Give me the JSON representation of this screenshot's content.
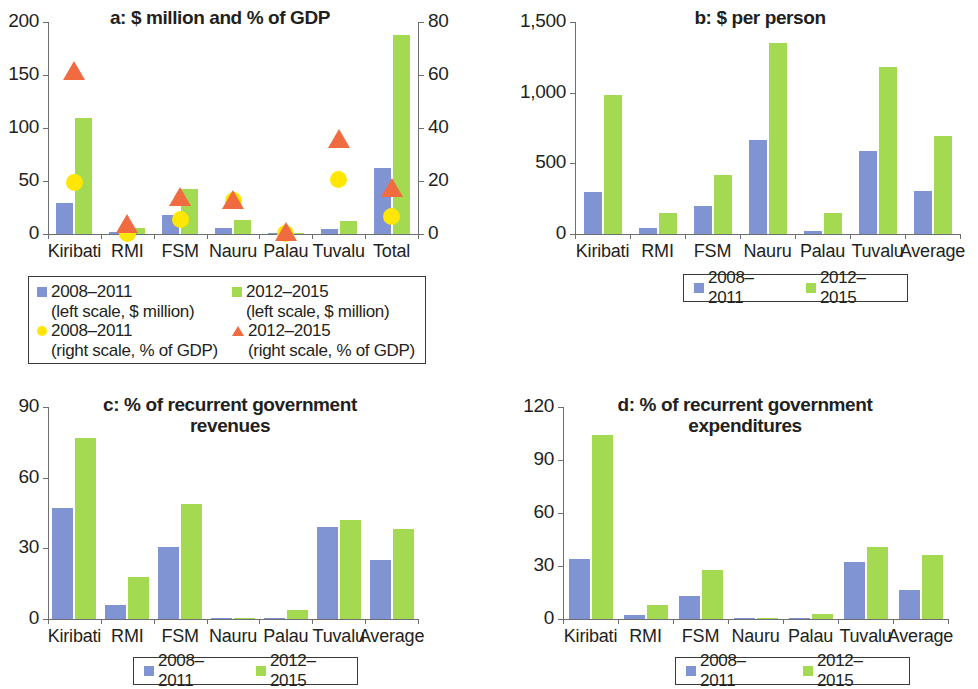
{
  "figure": {
    "panels": [
      "a",
      "b",
      "c",
      "d"
    ],
    "series_names": [
      "2008–2011",
      "2012–2015"
    ],
    "colors": {
      "blue": "#8094d4",
      "green": "#a3da51",
      "yellow": "#ffe605",
      "orange": "#f06c40",
      "axis": "#6d6e71",
      "text": "#231f20"
    }
  },
  "chart_data": [
    {
      "type": "bar",
      "panel": "a",
      "title": "a: $ million and % of GDP",
      "categories": [
        "Kiribati",
        "RMI",
        "FSM",
        "Nauru",
        "Palau",
        "Tuvalu",
        "Total"
      ],
      "xlabel": "",
      "ylabel": "",
      "ylim": [
        0,
        200
      ],
      "yticks": [
        0,
        50,
        100,
        150,
        200
      ],
      "ytick_labels": [
        "0",
        "50",
        "100",
        "150",
        "200"
      ],
      "y2lim": [
        0,
        80
      ],
      "y2ticks": [
        0,
        20,
        40,
        60,
        80
      ],
      "y2tick_labels": [
        "0",
        "20",
        "40",
        "60",
        "80"
      ],
      "grid": false,
      "legend_position": "below",
      "series": [
        {
          "name": "2008–2011 (left scale, $ million)",
          "type": "bar",
          "axis": "left",
          "color": "#8094d4",
          "values": [
            29,
            1.5,
            18,
            5.5,
            0.5,
            5,
            62
          ]
        },
        {
          "name": "2012–2015 (left scale, $ million)",
          "type": "bar",
          "axis": "left",
          "color": "#a3da51",
          "values": [
            109,
            5.5,
            42,
            13,
            1,
            12,
            188
          ]
        },
        {
          "name": "2008–2011 (right scale, % of GDP)",
          "type": "marker-circle",
          "axis": "right",
          "color": "#ffe605",
          "values": [
            19.5,
            0.3,
            5.5,
            12.5,
            0.2,
            20.5,
            6.5
          ]
        },
        {
          "name": "2012–2015 (right scale, % of GDP)",
          "type": "marker-triangle",
          "axis": "right",
          "color": "#f06c40",
          "values": [
            61,
            3.5,
            13.5,
            12.5,
            0.2,
            35.5,
            17
          ]
        }
      ],
      "legend": [
        {
          "marker": "square-blue",
          "line1": "2008–2011",
          "line2": "(left scale, $ million)"
        },
        {
          "marker": "square-green",
          "line1": "2012–2015",
          "line2": "(left scale, $ million)"
        },
        {
          "marker": "circle-yellow",
          "line1": "2008–2011",
          "line2": "(right scale, % of GDP)"
        },
        {
          "marker": "triangle-orange",
          "line1": "2012–2015",
          "line2": "(right scale, % of GDP)"
        }
      ]
    },
    {
      "type": "bar",
      "panel": "b",
      "title": "b: $ per person",
      "categories": [
        "Kiribati",
        "RMI",
        "FSM",
        "Nauru",
        "Palau",
        "Tuvalu",
        "Average"
      ],
      "xlabel": "",
      "ylabel": "",
      "ylim": [
        0,
        1500
      ],
      "yticks": [
        0,
        500,
        1000,
        1500
      ],
      "ytick_labels": [
        "0",
        "500",
        "1,000",
        "1,500"
      ],
      "grid": false,
      "legend_position": "below",
      "series": [
        {
          "name": "2008–2011",
          "color": "#8094d4",
          "values": [
            300,
            40,
            195,
            665,
            20,
            590,
            305
          ]
        },
        {
          "name": "2012–2015",
          "color": "#a3da51",
          "values": [
            980,
            150,
            420,
            1350,
            150,
            1185,
            690
          ]
        }
      ],
      "legend": [
        {
          "marker": "square-blue",
          "label": "2008–2011"
        },
        {
          "marker": "square-green",
          "label": "2012–2015"
        }
      ]
    },
    {
      "type": "bar",
      "panel": "c",
      "title": "c: % of recurrent government revenues",
      "title_lines": [
        "c: % of recurrent government",
        "revenues"
      ],
      "categories": [
        "Kiribati",
        "RMI",
        "FSM",
        "Nauru",
        "Palau",
        "Tuvalu",
        "Average"
      ],
      "xlabel": "",
      "ylabel": "",
      "ylim": [
        0,
        90
      ],
      "yticks": [
        0,
        30,
        60,
        90
      ],
      "ytick_labels": [
        "0",
        "30",
        "60",
        "90"
      ],
      "grid": false,
      "legend_position": "below",
      "series": [
        {
          "name": "2008–2011",
          "color": "#8094d4",
          "values": [
            47,
            6,
            30.5,
            0.5,
            0.4,
            39,
            25
          ]
        },
        {
          "name": "2012–2015",
          "color": "#a3da51",
          "values": [
            77,
            18,
            49,
            0.3,
            4,
            42,
            38
          ]
        }
      ],
      "legend": [
        {
          "marker": "square-blue",
          "label": "2008–2011"
        },
        {
          "marker": "square-green",
          "label": "2012–2015"
        }
      ]
    },
    {
      "type": "bar",
      "panel": "d",
      "title": "d: % of recurrent government expenditures",
      "title_lines": [
        "d: % of recurrent government",
        "expenditures"
      ],
      "categories": [
        "Kiribati",
        "RMI",
        "FSM",
        "Nauru",
        "Palau",
        "Tuvalu",
        "Average"
      ],
      "xlabel": "",
      "ylabel": "",
      "ylim": [
        0,
        120
      ],
      "yticks": [
        0,
        30,
        60,
        90,
        120
      ],
      "ytick_labels": [
        "0",
        "30",
        "60",
        "90",
        "120"
      ],
      "grid": false,
      "legend_position": "below",
      "series": [
        {
          "name": "2008–2011",
          "color": "#8094d4",
          "values": [
            34,
            2,
            13,
            0.2,
            0.3,
            32,
            16.5
          ]
        },
        {
          "name": "2012–2015",
          "color": "#a3da51",
          "values": [
            104,
            8,
            28,
            0.2,
            3,
            41,
            36
          ]
        }
      ],
      "legend": [
        {
          "marker": "square-blue",
          "label": "2008–2011"
        },
        {
          "marker": "square-green",
          "label": "2012–2015"
        }
      ]
    }
  ]
}
